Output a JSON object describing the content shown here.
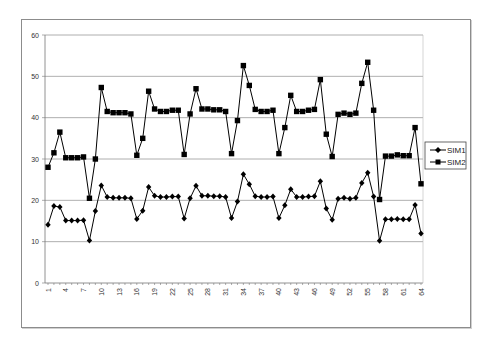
{
  "chart_data": {
    "type": "line",
    "title": "",
    "xlabel": "",
    "ylabel": "",
    "ylim": [
      0,
      60
    ],
    "yticks": [
      0,
      10,
      20,
      30,
      40,
      50,
      60
    ],
    "xtick_labels": [
      "1",
      "4",
      "7",
      "10",
      "13",
      "16",
      "19",
      "22",
      "25",
      "28",
      "31",
      "34",
      "37",
      "40",
      "43",
      "46",
      "49",
      "52",
      "55",
      "58",
      "61",
      "64"
    ],
    "grid": "horizontal",
    "legend_position": "right",
    "x": [
      1,
      2,
      3,
      4,
      5,
      6,
      7,
      8,
      9,
      10,
      11,
      12,
      13,
      14,
      15,
      16,
      17,
      18,
      19,
      20,
      21,
      22,
      23,
      24,
      25,
      26,
      27,
      28,
      29,
      30,
      31,
      32,
      33,
      34,
      35,
      36,
      37,
      38,
      39,
      40,
      41,
      42,
      43,
      44,
      45,
      46,
      47,
      48,
      49,
      50,
      51,
      52,
      53,
      54,
      55,
      56,
      57,
      58,
      59,
      60,
      61,
      62,
      63,
      64
    ],
    "series": [
      {
        "name": "SIM1",
        "marker": "diamond",
        "color": "#000000",
        "values": [
          14.1,
          18.6,
          18.4,
          15.1,
          15.1,
          15.1,
          15.2,
          10.3,
          17.4,
          23.6,
          20.8,
          20.6,
          20.6,
          20.6,
          20.5,
          15.5,
          17.5,
          23.2,
          21.1,
          20.8,
          20.8,
          20.9,
          20.9,
          15.6,
          20.5,
          23.5,
          21.1,
          21.1,
          21.0,
          21.0,
          20.8,
          15.7,
          19.7,
          26.3,
          23.9,
          21.0,
          20.8,
          20.8,
          20.9,
          15.7,
          18.8,
          22.7,
          20.8,
          20.8,
          20.9,
          21.0,
          24.6,
          18.0,
          15.3,
          20.4,
          20.6,
          20.4,
          20.6,
          24.2,
          26.7,
          20.9,
          10.2,
          15.4,
          15.4,
          15.5,
          15.4,
          15.4,
          18.9,
          12.0
        ]
      },
      {
        "name": "SIM2",
        "marker": "square",
        "color": "#000000",
        "values": [
          28.0,
          31.5,
          36.5,
          30.3,
          30.3,
          30.3,
          30.5,
          20.5,
          30.0,
          47.3,
          41.5,
          41.2,
          41.2,
          41.2,
          40.9,
          30.9,
          35.0,
          46.4,
          42.1,
          41.5,
          41.5,
          41.8,
          41.8,
          31.1,
          40.9,
          47.0,
          42.1,
          42.1,
          41.9,
          41.9,
          41.5,
          31.3,
          39.3,
          52.6,
          47.8,
          42.0,
          41.5,
          41.5,
          41.8,
          31.3,
          37.6,
          45.4,
          41.5,
          41.5,
          41.8,
          42.0,
          49.2,
          36.0,
          30.6,
          40.8,
          41.1,
          40.8,
          41.1,
          48.3,
          53.4,
          41.8,
          20.2,
          30.7,
          30.7,
          31.0,
          30.8,
          30.8,
          37.6,
          24.0
        ]
      }
    ]
  },
  "legend": {
    "items": [
      {
        "label": "SIM1",
        "marker": "diamond"
      },
      {
        "label": "SIM2",
        "marker": "square"
      }
    ]
  }
}
